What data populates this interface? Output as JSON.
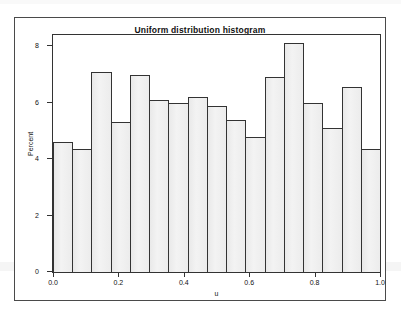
{
  "figure": {
    "title": "Uniform distribution histogram",
    "frame_color": "#4a4a4a"
  },
  "axes": {
    "y_title": "Percent",
    "x_title": "u",
    "y_ticks": [
      "0",
      "2",
      "4",
      "6",
      "8"
    ],
    "x_ticks": [
      "0.0",
      "0.2",
      "0.4",
      "0.6",
      "0.8",
      "1.0"
    ]
  },
  "chart_data": {
    "type": "bar",
    "title": "Uniform distribution histogram",
    "xlabel": "u",
    "ylabel": "Percent",
    "xlim": [
      0.0,
      1.0
    ],
    "ylim": [
      0,
      8.4
    ],
    "grid": false,
    "legend": null,
    "bar_color": "#efefef",
    "bar_edge_color": "#333333",
    "bin_width": 0.0588,
    "categories": [
      "0.000-0.059",
      "0.059-0.118",
      "0.118-0.176",
      "0.176-0.235",
      "0.235-0.294",
      "0.294-0.353",
      "0.353-0.412",
      "0.412-0.471",
      "0.471-0.529",
      "0.529-0.588",
      "0.588-0.647",
      "0.647-0.706",
      "0.706-0.765",
      "0.765-0.824",
      "0.824-0.882",
      "0.882-0.941",
      "0.941-1.000"
    ],
    "x": [
      0.029,
      0.088,
      0.147,
      0.206,
      0.265,
      0.324,
      0.382,
      0.441,
      0.5,
      0.559,
      0.618,
      0.676,
      0.735,
      0.794,
      0.853,
      0.912,
      0.971
    ],
    "values": [
      4.6,
      4.35,
      7.1,
      5.3,
      7.0,
      6.1,
      6.0,
      6.2,
      5.9,
      5.4,
      4.8,
      6.9,
      8.1,
      6.0,
      5.1,
      6.55,
      4.35
    ],
    "y_tick_values": [
      0,
      2,
      4,
      6,
      8
    ],
    "x_tick_values": [
      0.0,
      0.2,
      0.4,
      0.6,
      0.8,
      1.0
    ]
  }
}
